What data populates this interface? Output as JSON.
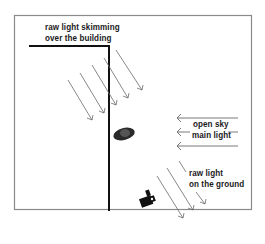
{
  "diagram": {
    "type": "lighting-diagram",
    "labels": {
      "top_line1": "raw light skimming",
      "top_line2": "over the building",
      "sky_line1": "open sky",
      "sky_line2": "main light",
      "ground_line1": "raw light",
      "ground_line2": "on the ground"
    },
    "elements": [
      "building-wall",
      "subject",
      "camera",
      "sky-light-arrows",
      "skimming-light-arrows",
      "ground-light-arrows"
    ],
    "colors": {
      "frame": "#8a8a8a",
      "wall": "#111111",
      "arrows": "#6a6a6a",
      "subject": "#2a2a2a",
      "text": "#1a1a1a"
    }
  }
}
